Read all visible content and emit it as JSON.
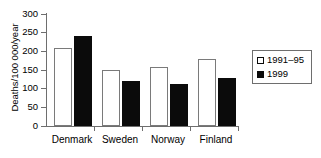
{
  "chart_data": {
    "type": "bar",
    "title": "",
    "xlabel": "",
    "ylabel": "Deaths/100 000/year",
    "ylim": [
      0,
      300
    ],
    "yticks": [
      0,
      50,
      100,
      150,
      200,
      250,
      300
    ],
    "ytick_labels": [
      "0",
      "50",
      "100",
      "150",
      "200",
      "250",
      "300"
    ],
    "grid": false,
    "legend_position": "right",
    "categories": [
      "Denmark",
      "Sweden",
      "Norway",
      "Finland"
    ],
    "series": [
      {
        "name": "1991–95",
        "style": "open",
        "color": "#ffffff",
        "edge_color": "#000000",
        "values": [
          208,
          151,
          157,
          180
        ]
      },
      {
        "name": "1999",
        "style": "filled",
        "color": "#000000",
        "edge_color": "#000000",
        "values": [
          242,
          120,
          113,
          128
        ]
      }
    ]
  },
  "legend": {
    "entries": [
      {
        "label": "1991–95",
        "swatch": "open-square-swatch"
      },
      {
        "label": "1999",
        "swatch": "filled-square-swatch"
      }
    ]
  }
}
